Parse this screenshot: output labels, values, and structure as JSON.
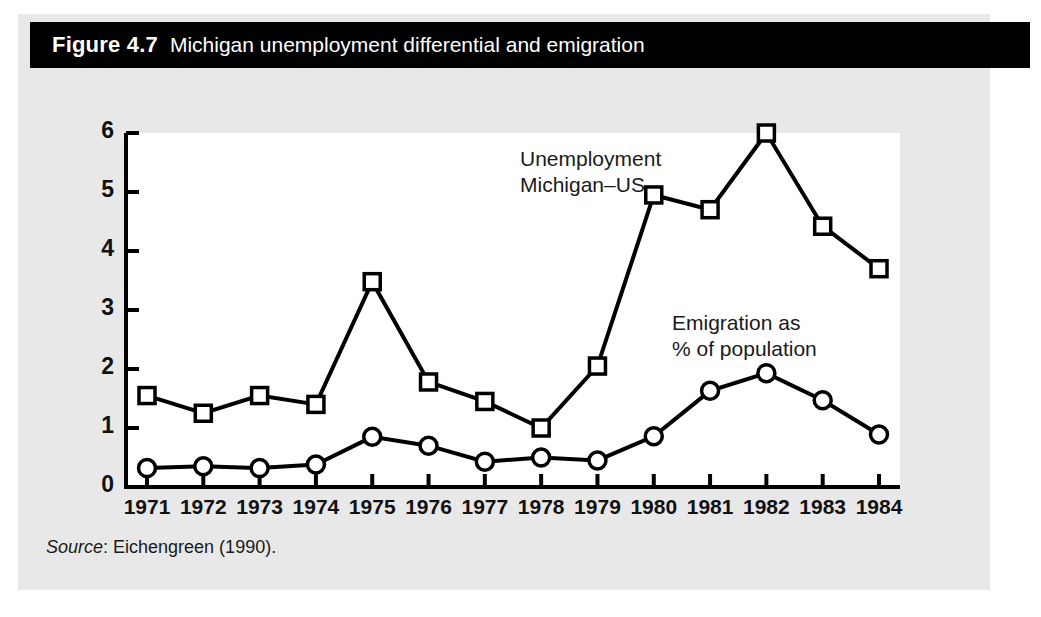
{
  "figure": {
    "number": "Figure 4.7",
    "title": "Michigan unemployment differential and emigration",
    "source_word": "Source",
    "source_text": ": Eichengreen (1990)."
  },
  "annotations": {
    "unemployment": "Unemployment\nMichigan–US",
    "emigration": "Emigration as\n% of population"
  },
  "colors": {
    "page_background": "#ffffff",
    "panel_background": "#e8e8e8",
    "title_band": "#000000",
    "title_text": "#ffffff",
    "plot_background": "#ffffff",
    "axis": "#000000",
    "series": "#000000",
    "marker_fill": "#ffffff"
  },
  "chart_data": {
    "type": "line",
    "title": "Michigan unemployment differential and emigration",
    "xlabel": "",
    "ylabel": "",
    "xlim": [
      1971,
      1984
    ],
    "ylim": [
      0,
      6
    ],
    "yticks": [
      0,
      1,
      2,
      3,
      4,
      5,
      6
    ],
    "ytick_labels": [
      "0",
      "1",
      "2",
      "3",
      "4",
      "5",
      "6"
    ],
    "grid": false,
    "legend": "none (in-plot text annotations)",
    "categories": [
      1971,
      1972,
      1973,
      1974,
      1975,
      1976,
      1977,
      1978,
      1979,
      1980,
      1981,
      1982,
      1983,
      1984
    ],
    "xtick_labels": [
      "1971",
      "1972",
      "1973",
      "1974",
      "1975",
      "1976",
      "1977",
      "1978",
      "1979",
      "1980",
      "1981",
      "1982",
      "1983",
      "1984"
    ],
    "series": [
      {
        "name": "Unemployment Michigan–US",
        "marker": "square",
        "values": [
          1.55,
          1.25,
          1.55,
          1.4,
          3.48,
          1.78,
          1.45,
          1.0,
          2.05,
          4.95,
          4.7,
          6.0,
          4.42,
          3.7
        ]
      },
      {
        "name": "Emigration as % of population",
        "marker": "circle",
        "values": [
          0.32,
          0.35,
          0.32,
          0.38,
          0.85,
          0.7,
          0.43,
          0.5,
          0.45,
          0.86,
          1.63,
          1.93,
          1.47,
          0.89
        ]
      }
    ]
  }
}
